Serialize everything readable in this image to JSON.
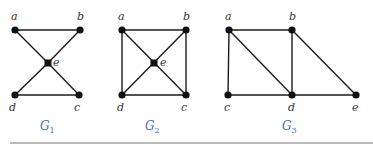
{
  "graphs": [
    {
      "name": "G",
      "subscript": "1",
      "label_pos": [
        40,
        130
      ],
      "vertices": [
        {
          "id": "a",
          "x": 15,
          "y": 30,
          "lx": 11,
          "ly": 20
        },
        {
          "id": "b",
          "x": 80,
          "y": 30,
          "lx": 77,
          "ly": 20
        },
        {
          "id": "c",
          "x": 79,
          "y": 95,
          "lx": 74,
          "ly": 111
        },
        {
          "id": "d",
          "x": 15,
          "y": 95,
          "lx": 9,
          "ly": 111
        },
        {
          "id": "e",
          "x": 48,
          "y": 63,
          "lx": 53,
          "ly": 66,
          "square": true
        }
      ],
      "edges": [
        [
          "a",
          "b"
        ],
        [
          "a",
          "e"
        ],
        [
          "e",
          "c"
        ],
        [
          "b",
          "e"
        ],
        [
          "e",
          "d"
        ],
        [
          "d",
          "c"
        ]
      ]
    },
    {
      "name": "G",
      "subscript": "2",
      "label_pos": [
        145,
        130
      ],
      "vertices": [
        {
          "id": "a",
          "x": 122,
          "y": 30,
          "lx": 118,
          "ly": 20
        },
        {
          "id": "b",
          "x": 186,
          "y": 30,
          "lx": 183,
          "ly": 20
        },
        {
          "id": "c",
          "x": 186,
          "y": 95,
          "lx": 181,
          "ly": 111
        },
        {
          "id": "d",
          "x": 122,
          "y": 95,
          "lx": 117,
          "ly": 111
        },
        {
          "id": "e",
          "x": 154,
          "y": 63,
          "lx": 160,
          "ly": 66,
          "square": true
        }
      ],
      "edges": [
        [
          "a",
          "b"
        ],
        [
          "b",
          "c"
        ],
        [
          "c",
          "d"
        ],
        [
          "d",
          "a"
        ],
        [
          "a",
          "c"
        ],
        [
          "b",
          "d"
        ]
      ]
    },
    {
      "name": "G",
      "subscript": "3",
      "label_pos": [
        282,
        130
      ],
      "vertices": [
        {
          "id": "a",
          "x": 229,
          "y": 30,
          "lx": 225,
          "ly": 20
        },
        {
          "id": "b",
          "x": 292,
          "y": 30,
          "lx": 289,
          "ly": 20
        },
        {
          "id": "c",
          "x": 228,
          "y": 95,
          "lx": 224,
          "ly": 111
        },
        {
          "id": "d",
          "x": 292,
          "y": 95,
          "lx": 288,
          "ly": 111
        },
        {
          "id": "e",
          "x": 356,
          "y": 95,
          "lx": 352,
          "ly": 111
        }
      ],
      "edges": [
        [
          "a",
          "b"
        ],
        [
          "a",
          "c"
        ],
        [
          "a",
          "d"
        ],
        [
          "b",
          "d"
        ],
        [
          "b",
          "e"
        ],
        [
          "c",
          "d"
        ],
        [
          "d",
          "e"
        ]
      ]
    }
  ],
  "rule": {
    "x1": 10,
    "x2": 373,
    "y": 143
  }
}
